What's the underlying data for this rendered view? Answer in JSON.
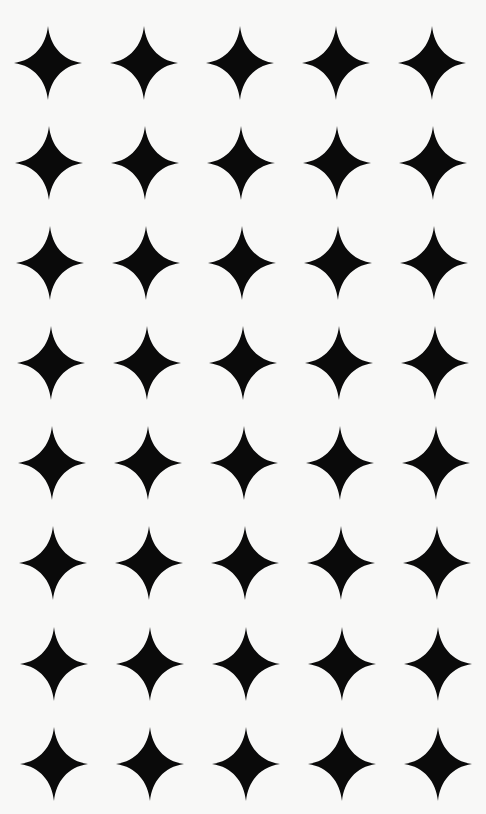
{
  "pattern": {
    "name": "four-point star grid",
    "background_color": "#f8f8f7",
    "star_color": "#0a0a0a",
    "star_icon": "four-point-star-icon",
    "rows": 8,
    "columns": 5,
    "star_width": 68,
    "star_height": 74,
    "row_centers_y": [
      63,
      163,
      263,
      363,
      463,
      563,
      664,
      764
    ],
    "row_first_center_x": [
      48,
      49,
      50,
      51,
      52,
      53,
      54,
      54
    ],
    "column_spacing": 96
  }
}
